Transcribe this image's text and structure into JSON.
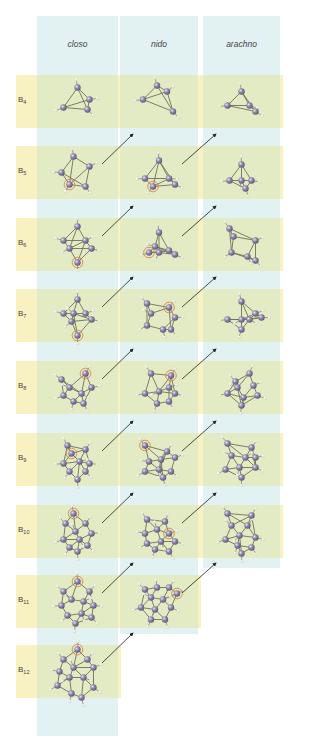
{
  "figure": {
    "columns": [
      {
        "key": "closo",
        "label": "closo",
        "x": 37,
        "width": 81,
        "bottom": 736
      },
      {
        "key": "nido",
        "label": "nido",
        "x": 120,
        "width": 78,
        "bottom": 634
      },
      {
        "key": "arachno",
        "label": "arachno",
        "x": 203,
        "width": 77,
        "bottom": 568
      }
    ],
    "column_top": 16,
    "band_right": 283,
    "rows": [
      {
        "label": "B",
        "sub": "4",
        "y": 75
      },
      {
        "label": "B",
        "sub": "5",
        "y": 146
      },
      {
        "label": "B",
        "sub": "6",
        "y": 218
      },
      {
        "label": "B",
        "sub": "7",
        "y": 289
      },
      {
        "label": "B",
        "sub": "8",
        "y": 361
      },
      {
        "label": "B",
        "sub": "9",
        "y": 433
      },
      {
        "label": "B",
        "sub": "10",
        "y": 505
      },
      {
        "label": "B",
        "sub": "11",
        "y": 575
      },
      {
        "label": "B",
        "sub": "12",
        "y": 645
      }
    ],
    "colors": {
      "column_bg": "#e2f2f2",
      "row_bg": "#f8f2c2",
      "overlap_bg": "#e2ebc4",
      "boron": "#8f86a8",
      "boron_dark": "#5d5478",
      "hydrogen": "#f4f4f0",
      "bond": "#6f7258",
      "highlight": "#d9824a",
      "arrow": "#222222"
    },
    "arrows": [
      {
        "from": "closo-B5",
        "to": "nido-B4"
      },
      {
        "from": "nido-B5",
        "to": "arachno-B4"
      },
      {
        "from": "closo-B6",
        "to": "nido-B5"
      },
      {
        "from": "nido-B6",
        "to": "arachno-B5"
      },
      {
        "from": "closo-B7",
        "to": "nido-B6"
      },
      {
        "from": "nido-B7",
        "to": "arachno-B6"
      },
      {
        "from": "closo-B8",
        "to": "nido-B7"
      },
      {
        "from": "nido-B8",
        "to": "arachno-B7"
      },
      {
        "from": "closo-B9",
        "to": "nido-B8"
      },
      {
        "from": "nido-B9",
        "to": "arachno-B8"
      },
      {
        "from": "closo-B10",
        "to": "nido-B9"
      },
      {
        "from": "nido-B10",
        "to": "arachno-B9"
      },
      {
        "from": "closo-B11",
        "to": "nido-B10"
      },
      {
        "from": "nido-B11",
        "to": "arachno-B10"
      },
      {
        "from": "closo-B12",
        "to": "nido-B11"
      }
    ],
    "molecules": [
      {
        "id": "closo-B4",
        "col": 0,
        "row": 0,
        "n": 4,
        "highlight": -1,
        "atoms": [
          [
            0,
            -14
          ],
          [
            -14,
            6
          ],
          [
            12,
            -2
          ],
          [
            10,
            8
          ]
        ]
      },
      {
        "id": "nido-B4",
        "col": 1,
        "row": 0,
        "n": 4,
        "highlight": -1,
        "atoms": [
          [
            -2,
            -16
          ],
          [
            -16,
            -2
          ],
          [
            8,
            -10
          ],
          [
            14,
            10
          ]
        ]
      },
      {
        "id": "arachno-B4",
        "col": 2,
        "row": 0,
        "n": 4,
        "highlight": -1,
        "atoms": [
          [
            0,
            -10
          ],
          [
            -14,
            4
          ],
          [
            8,
            4
          ],
          [
            14,
            10
          ]
        ]
      },
      {
        "id": "closo-B5",
        "col": 0,
        "row": 1,
        "n": 5,
        "highlight": 2,
        "atoms": [
          [
            -4,
            -16
          ],
          [
            -16,
            0
          ],
          [
            -8,
            12
          ],
          [
            12,
            -6
          ],
          [
            8,
            14
          ]
        ]
      },
      {
        "id": "nido-B5",
        "col": 1,
        "row": 1,
        "n": 5,
        "highlight": 2,
        "atoms": [
          [
            0,
            -12
          ],
          [
            -14,
            6
          ],
          [
            -6,
            14
          ],
          [
            10,
            6
          ],
          [
            16,
            12
          ]
        ]
      },
      {
        "id": "arachno-B5",
        "col": 2,
        "row": 1,
        "n": 5,
        "highlight": -1,
        "atoms": [
          [
            0,
            -8
          ],
          [
            -12,
            8
          ],
          [
            0,
            8
          ],
          [
            10,
            8
          ],
          [
            4,
            16
          ]
        ]
      },
      {
        "id": "closo-B6",
        "col": 0,
        "row": 2,
        "n": 6,
        "highlight": 5,
        "atoms": [
          [
            0,
            -18
          ],
          [
            -14,
            -4
          ],
          [
            -8,
            4
          ],
          [
            8,
            -4
          ],
          [
            14,
            4
          ],
          [
            0,
            18
          ]
        ]
      },
      {
        "id": "nido-B6",
        "col": 1,
        "row": 2,
        "n": 6,
        "highlight": 1,
        "atoms": [
          [
            0,
            -12
          ],
          [
            -10,
            8
          ],
          [
            0,
            8
          ],
          [
            -4,
            2
          ],
          [
            10,
            6
          ],
          [
            16,
            10
          ]
        ]
      },
      {
        "id": "arachno-B6",
        "col": 2,
        "row": 2,
        "n": 6,
        "highlight": -1,
        "atoms": [
          [
            -12,
            -16
          ],
          [
            -8,
            -8
          ],
          [
            14,
            -4
          ],
          [
            -10,
            8
          ],
          [
            6,
            12
          ],
          [
            14,
            16
          ]
        ]
      },
      {
        "id": "closo-B7",
        "col": 0,
        "row": 3,
        "n": 7,
        "highlight": 6,
        "atoms": [
          [
            0,
            -16
          ],
          [
            -14,
            -2
          ],
          [
            -4,
            -2
          ],
          [
            8,
            -2
          ],
          [
            14,
            4
          ],
          [
            -6,
            6
          ],
          [
            0,
            20
          ]
        ]
      },
      {
        "id": "nido-B7",
        "col": 1,
        "row": 3,
        "n": 7,
        "highlight": 2,
        "atoms": [
          [
            -12,
            -12
          ],
          [
            -8,
            -2
          ],
          [
            10,
            -8
          ],
          [
            16,
            2
          ],
          [
            -12,
            10
          ],
          [
            4,
            14
          ],
          [
            12,
            14
          ]
        ]
      },
      {
        "id": "arachno-B7",
        "col": 2,
        "row": 3,
        "n": 7,
        "highlight": -1,
        "atoms": [
          [
            0,
            -14
          ],
          [
            -14,
            4
          ],
          [
            0,
            4
          ],
          [
            14,
            -2
          ],
          [
            20,
            2
          ],
          [
            0,
            14
          ],
          [
            8,
            4
          ]
        ]
      },
      {
        "id": "closo-B8",
        "col": 0,
        "row": 4,
        "n": 8,
        "highlight": 1,
        "atoms": [
          [
            -16,
            -8
          ],
          [
            8,
            -14
          ],
          [
            -8,
            0
          ],
          [
            14,
            0
          ],
          [
            -14,
            8
          ],
          [
            4,
            6
          ],
          [
            -4,
            14
          ],
          [
            6,
            16
          ]
        ]
      },
      {
        "id": "nido-B8",
        "col": 1,
        "row": 4,
        "n": 8,
        "highlight": 1,
        "atoms": [
          [
            -8,
            -14
          ],
          [
            12,
            -12
          ],
          [
            -14,
            6
          ],
          [
            0,
            4
          ],
          [
            10,
            0
          ],
          [
            16,
            6
          ],
          [
            -2,
            16
          ],
          [
            10,
            14
          ]
        ]
      },
      {
        "id": "arachno-B8",
        "col": 2,
        "row": 4,
        "n": 8,
        "highlight": -1,
        "atoms": [
          [
            8,
            -14
          ],
          [
            -6,
            -6
          ],
          [
            12,
            -2
          ],
          [
            -14,
            6
          ],
          [
            -4,
            0
          ],
          [
            2,
            10
          ],
          [
            16,
            8
          ],
          [
            0,
            18
          ]
        ]
      },
      {
        "id": "closo-B9",
        "col": 0,
        "row": 5,
        "n": 9,
        "highlight": 1,
        "atoms": [
          [
            -10,
            -14
          ],
          [
            -6,
            -6
          ],
          [
            8,
            -10
          ],
          [
            -14,
            4
          ],
          [
            2,
            2
          ],
          [
            12,
            4
          ],
          [
            -8,
            12
          ],
          [
            8,
            12
          ],
          [
            0,
            20
          ]
        ]
      },
      {
        "id": "nido-B9",
        "col": 1,
        "row": 5,
        "n": 9,
        "highlight": 0,
        "atoms": [
          [
            -14,
            -14
          ],
          [
            8,
            -8
          ],
          [
            -10,
            2
          ],
          [
            2,
            0
          ],
          [
            16,
            -2
          ],
          [
            -14,
            12
          ],
          [
            0,
            10
          ],
          [
            12,
            12
          ],
          [
            4,
            18
          ]
        ]
      },
      {
        "id": "arachno-B9",
        "col": 2,
        "row": 5,
        "n": 9,
        "highlight": -1,
        "atoms": [
          [
            -14,
            -16
          ],
          [
            10,
            -12
          ],
          [
            -10,
            -4
          ],
          [
            4,
            -2
          ],
          [
            -16,
            10
          ],
          [
            -2,
            8
          ],
          [
            14,
            8
          ],
          [
            0,
            18
          ],
          [
            14,
            -2
          ]
        ]
      },
      {
        "id": "closo-B10",
        "col": 0,
        "row": 6,
        "n": 10,
        "highlight": 0,
        "atoms": [
          [
            -4,
            -18
          ],
          [
            -12,
            -8
          ],
          [
            8,
            -8
          ],
          [
            -2,
            0
          ],
          [
            14,
            2
          ],
          [
            -14,
            8
          ],
          [
            2,
            8
          ],
          [
            -8,
            16
          ],
          [
            10,
            14
          ],
          [
            0,
            20
          ]
        ]
      },
      {
        "id": "nido-B10",
        "col": 1,
        "row": 6,
        "n": 10,
        "highlight": 4,
        "atoms": [
          [
            -12,
            -12
          ],
          [
            6,
            -10
          ],
          [
            -14,
            2
          ],
          [
            -2,
            -2
          ],
          [
            10,
            2
          ],
          [
            -12,
            12
          ],
          [
            2,
            10
          ],
          [
            16,
            10
          ],
          [
            -4,
            18
          ],
          [
            10,
            20
          ]
        ]
      },
      {
        "id": "arachno-B10",
        "col": 2,
        "row": 6,
        "n": 10,
        "highlight": -1,
        "atoms": [
          [
            -14,
            -18
          ],
          [
            10,
            -16
          ],
          [
            -10,
            -6
          ],
          [
            6,
            -6
          ],
          [
            -2,
            4
          ],
          [
            -16,
            8
          ],
          [
            14,
            6
          ],
          [
            -4,
            14
          ],
          [
            10,
            16
          ],
          [
            0,
            22
          ]
        ]
      },
      {
        "id": "closo-B11",
        "col": 0,
        "row": 7,
        "n": 11,
        "highlight": 0,
        "atoms": [
          [
            0,
            -20
          ],
          [
            -14,
            -10
          ],
          [
            12,
            -10
          ],
          [
            -6,
            -2
          ],
          [
            6,
            0
          ],
          [
            -16,
            4
          ],
          [
            16,
            4
          ],
          [
            -10,
            14
          ],
          [
            4,
            12
          ],
          [
            14,
            16
          ],
          [
            -2,
            22
          ]
        ]
      },
      {
        "id": "nido-B11",
        "col": 1,
        "row": 7,
        "n": 11,
        "highlight": 4,
        "atoms": [
          [
            -14,
            -12
          ],
          [
            -2,
            -14
          ],
          [
            10,
            -14
          ],
          [
            -8,
            -4
          ],
          [
            18,
            -8
          ],
          [
            4,
            -2
          ],
          [
            -18,
            6
          ],
          [
            -4,
            8
          ],
          [
            12,
            6
          ],
          [
            -8,
            18
          ],
          [
            6,
            18
          ]
        ]
      },
      {
        "id": "closo-B12",
        "col": 0,
        "row": 8,
        "n": 12,
        "highlight": 0,
        "atoms": [
          [
            0,
            -22
          ],
          [
            -14,
            -12
          ],
          [
            10,
            -12
          ],
          [
            -18,
            0
          ],
          [
            -4,
            -4
          ],
          [
            16,
            -4
          ],
          [
            -8,
            6
          ],
          [
            6,
            6
          ],
          [
            -20,
            14
          ],
          [
            16,
            16
          ],
          [
            -6,
            22
          ],
          [
            4,
            26
          ]
        ]
      }
    ]
  }
}
